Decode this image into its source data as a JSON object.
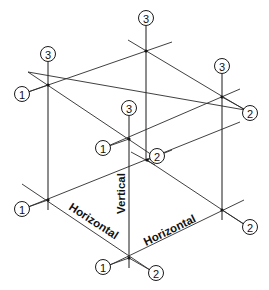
{
  "diagram": {
    "title": "",
    "axis_labels": {
      "vertical": "Vertical",
      "horizontal_left": "Horizontal",
      "horizontal_right": "Horizontal"
    },
    "axis_markers": {
      "one": "1",
      "two": "2",
      "three": "3"
    },
    "colors": {
      "line": "#1a1a1a",
      "background": "#ffffff"
    }
  }
}
